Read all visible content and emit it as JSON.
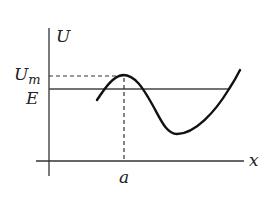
{
  "diagram": {
    "type": "potential-energy-curve",
    "axes": {
      "y_label": "U",
      "x_label": "x"
    },
    "levels": {
      "peak_label": "U",
      "peak_subscript": "m",
      "energy_label": "E"
    },
    "markers": {
      "peak_position_label": "a"
    },
    "colors": {
      "ink": "#222222",
      "background": "#ffffff"
    }
  }
}
